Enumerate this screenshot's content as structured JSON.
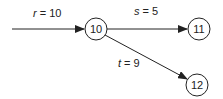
{
  "diagram": {
    "nodes": [
      {
        "id": "10",
        "label": "10"
      },
      {
        "id": "11",
        "label": "11"
      },
      {
        "id": "12",
        "label": "12"
      }
    ],
    "edges": [
      {
        "from": "",
        "to": "10",
        "var": "r",
        "eq": " = 10"
      },
      {
        "from": "10",
        "to": "11",
        "var": "s",
        "eq": " = 5"
      },
      {
        "from": "10",
        "to": "12",
        "var": "t",
        "eq": " = 9"
      }
    ]
  }
}
